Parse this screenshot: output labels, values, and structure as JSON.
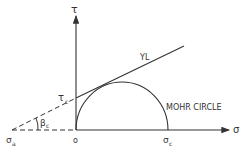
{
  "diagram": {
    "axes": {
      "y_label": "τ",
      "x_label": "σ",
      "origin_label": "o"
    },
    "labels": {
      "yield_line": "YL",
      "mohr_circle": "MOHR CIRCLE",
      "tau_c": "τ",
      "tau_c_sub": "c",
      "beta_c": "β",
      "beta_c_sub": "c",
      "sigma_a": "σ",
      "sigma_a_sub": "a",
      "sigma_c": "σ",
      "sigma_c_sub": "c"
    },
    "colors": {
      "line": "#333333",
      "background": "#ffffff"
    }
  }
}
